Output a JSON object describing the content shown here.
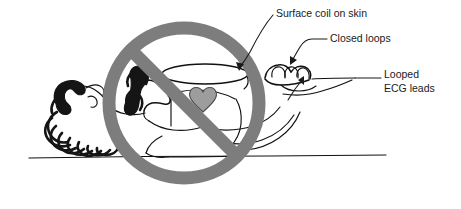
{
  "figure": {
    "background_color": "#ffffff",
    "ink_color": "#111111",
    "prohibition_color": "#7d7d7d",
    "heart_color": "#9d9d9d",
    "hair_color": "#151515"
  },
  "annotations": [
    {
      "id": "surface-coil",
      "label": "Surface coil on skin",
      "text_x": 276,
      "text_y": 17,
      "points_to": "surface coil ellipse on patient chest"
    },
    {
      "id": "closed-loops",
      "label": "Closed loops",
      "text_x": 330,
      "text_y": 42,
      "points_to": "patient hand forming a closed loop"
    },
    {
      "id": "looped-ecg-leads",
      "label_line1": "Looped",
      "label_line2": "ECG leads",
      "text_x": 384,
      "text_y": 78,
      "points_to": "ECG lead cable looped near the wrist"
    }
  ],
  "prohibition_sign": {
    "name": "no-symbol",
    "center_x": 184,
    "center_y": 103,
    "radius": 75,
    "stroke_width": 13,
    "slash_angle_degrees": 45
  },
  "scene_parts": [
    {
      "name": "patient-head",
      "label": "Patient head with curly hair"
    },
    {
      "name": "patient-torso",
      "label": "Patient torso"
    },
    {
      "name": "patient-arm",
      "label": "Patient arm crossing chest"
    },
    {
      "name": "patient-hand",
      "label": "Patient hand with fingers"
    },
    {
      "name": "surface-coil",
      "label": "Surface coil ellipse"
    },
    {
      "name": "heart",
      "label": "Heart"
    },
    {
      "name": "ecg-lead-cable",
      "label": "Looped ECG lead cable"
    },
    {
      "name": "examination-table",
      "label": "Examination table surface line"
    }
  ]
}
